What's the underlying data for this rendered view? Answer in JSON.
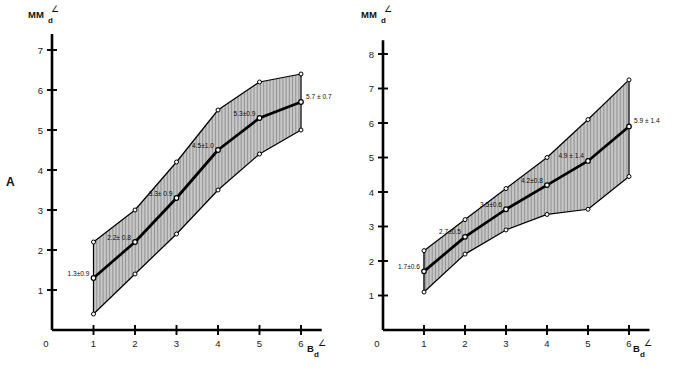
{
  "figure": {
    "panel_a_letter": "A",
    "panel_b_letter": "B"
  },
  "chart_data": [
    {
      "id": "panel-a",
      "type": "line",
      "title": "",
      "xlabel": "B",
      "xlabel_sub": "d",
      "xlabel_sup": "∠",
      "ylabel": "MM",
      "ylabel_sub": "d",
      "ylabel_sup": "∠",
      "x": [
        1,
        2,
        3,
        4,
        5,
        6
      ],
      "xticks": [
        "0",
        "1",
        "2",
        "3",
        "4",
        "5",
        "6"
      ],
      "yticks": [
        "1",
        "2",
        "3",
        "4",
        "5",
        "6",
        "7"
      ],
      "xlim": [
        0,
        6.5
      ],
      "ylim": [
        0,
        7.4
      ],
      "grid": false,
      "legend": "none",
      "series": [
        {
          "name": "mean",
          "values": [
            1.3,
            2.2,
            3.3,
            4.5,
            5.3,
            5.7
          ]
        },
        {
          "name": "upper (mean + SD)",
          "values": [
            2.2,
            3.0,
            4.2,
            5.5,
            6.2,
            6.4
          ]
        },
        {
          "name": "lower (mean - SD)",
          "values": [
            0.4,
            1.4,
            2.4,
            3.5,
            4.4,
            5.0
          ]
        }
      ],
      "sd": [
        0.9,
        0.8,
        0.9,
        1.0,
        0.9,
        0.7
      ],
      "point_labels": [
        "1.3±0.9",
        "2.2± 0.8",
        "3.3± 0.9",
        "4.5±1.0",
        "5.3±0.9",
        "5.7 ± 0.7"
      ]
    },
    {
      "id": "panel-b",
      "type": "line",
      "title": "",
      "xlabel": "B",
      "xlabel_sub": "d",
      "xlabel_sup": "∠",
      "ylabel": "MM",
      "ylabel_sub": "d",
      "ylabel_sup": "∠",
      "x": [
        1,
        2,
        3,
        4,
        5,
        6
      ],
      "xticks": [
        "0",
        "1",
        "2",
        "3",
        "4",
        "5",
        "6"
      ],
      "yticks": [
        "1",
        "2",
        "3",
        "4",
        "5",
        "6",
        "7",
        "8"
      ],
      "xlim": [
        0,
        6.5
      ],
      "ylim": [
        0,
        8.4
      ],
      "grid": false,
      "legend": "none",
      "series": [
        {
          "name": "mean",
          "values": [
            1.7,
            2.7,
            3.5,
            4.2,
            4.9,
            5.9
          ]
        },
        {
          "name": "upper (mean + SD)",
          "values": [
            2.3,
            3.2,
            4.1,
            5.0,
            6.1,
            7.25
          ]
        },
        {
          "name": "lower (mean - SD)",
          "values": [
            1.1,
            2.2,
            2.9,
            3.35,
            3.5,
            4.45
          ]
        }
      ],
      "sd": [
        0.6,
        0.5,
        0.6,
        0.8,
        1.4,
        1.4
      ],
      "point_labels": [
        "1.7±0.6",
        "2.7±0.5",
        "3.5±0.6",
        "4.2±0.8",
        "4.9 ± 1.4",
        "5.9 ± 1.4"
      ]
    }
  ]
}
